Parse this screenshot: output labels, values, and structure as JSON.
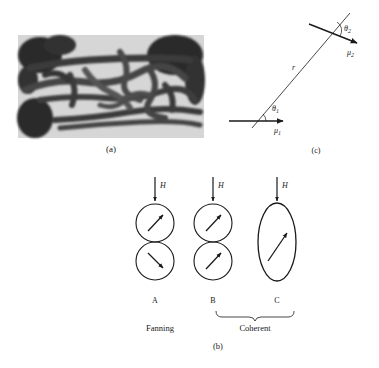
{
  "figure": {
    "panel_a": {
      "label": "(a)",
      "description": "micrograph of chain-like elongated particles"
    },
    "panel_b": {
      "label": "(b)",
      "field_label": "H",
      "configurations": [
        {
          "id": "A",
          "label": "A",
          "shape": "two-spheres",
          "moments": [
            "up-right",
            "down-right"
          ]
        },
        {
          "id": "B",
          "label": "B",
          "shape": "two-spheres",
          "moments": [
            "up-right",
            "up-right"
          ]
        },
        {
          "id": "C",
          "label": "C",
          "shape": "ellipsoid",
          "moments": [
            "up-right"
          ]
        }
      ],
      "mode_labels": {
        "fanning": "Fanning",
        "coherent": "Coherent"
      }
    },
    "panel_c": {
      "label": "(c)",
      "r_label": "r",
      "theta1": "θ",
      "theta1_sub": "1",
      "theta2": "θ",
      "theta2_sub": "2",
      "mu1": "μ",
      "mu1_sub": "1",
      "mu2": "μ",
      "mu2_sub": "2"
    }
  }
}
